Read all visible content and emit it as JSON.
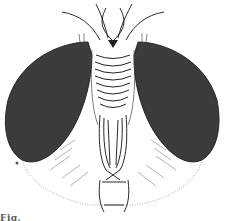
{
  "figure": {
    "style": "pen-and-ink scientific illustration",
    "caption_fragment": "Fig.",
    "colors": {
      "ink": "#1a1a1a",
      "eye_fill": "#3a3a3a",
      "background": "#ffffff"
    }
  }
}
